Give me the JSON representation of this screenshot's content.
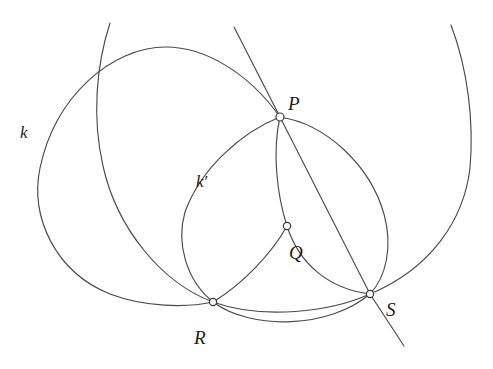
{
  "figure": {
    "type": "geometry-diagram",
    "width": 493,
    "height": 369,
    "background": "#ffffff",
    "stroke_color": "#4a4a4a",
    "label_color": "#1c1c1c",
    "node_fill": "#ffffff"
  },
  "points": [
    {
      "id": "P",
      "label": "P",
      "x": 280,
      "y": 117,
      "label_x": 288,
      "label_y": 94
    },
    {
      "id": "Q",
      "label": "Q",
      "x": 287,
      "y": 226,
      "label_x": 289,
      "label_y": 243
    },
    {
      "id": "R",
      "label": "R",
      "x": 213,
      "y": 302,
      "label_x": 194,
      "label_y": 328
    },
    {
      "id": "S",
      "label": "S",
      "x": 370,
      "y": 294,
      "label_x": 386,
      "label_y": 300
    }
  ],
  "curve_labels": [
    {
      "id": "k",
      "label": "k",
      "x": 20,
      "y": 124
    },
    {
      "id": "k-prime",
      "label": "k′",
      "x": 196,
      "y": 173
    }
  ],
  "curves": [
    {
      "id": "circle-k",
      "name": "circle k",
      "kind": "circle",
      "cx": 171,
      "cy": 176,
      "r": 131
    },
    {
      "id": "circle-second-large",
      "name": "second large circle through R and S",
      "kind": "circle",
      "cx": 262,
      "cy": 182,
      "r": 152
    },
    {
      "id": "circle-k-prime",
      "name": "circle k prime through P and R",
      "kind": "circle",
      "cx": 257,
      "cy": 215,
      "r": 101
    },
    {
      "id": "circle-right",
      "name": "circle through P Q and S",
      "kind": "circle",
      "cx": 300,
      "cy": 206,
      "r": 92
    },
    {
      "id": "arc-far-right",
      "name": "far right arc through S",
      "kind": "arc"
    },
    {
      "id": "arc-lower-rs",
      "name": "lower arc between R and S",
      "kind": "arc"
    },
    {
      "id": "line-ps",
      "name": "straight line through P and S",
      "kind": "line",
      "x1": 234,
      "y1": 27,
      "x2": 404,
      "y2": 346
    }
  ]
}
